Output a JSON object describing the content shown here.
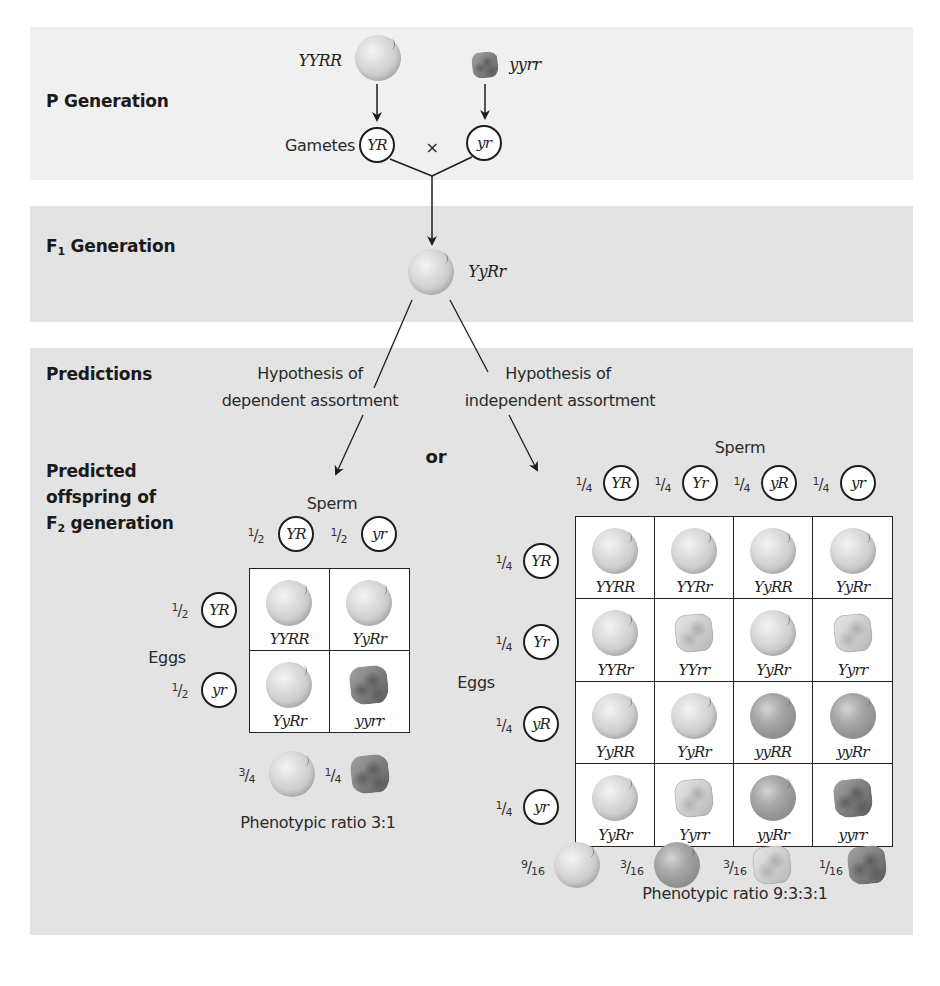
{
  "colors": {
    "panel_p_bg": "#f0f0f0",
    "panel_bg": "#e3e3e3",
    "round_yellow": "#d0d0d0",
    "round_green": "#9a9a9a",
    "wrinkled_yellow": "#cfcfcf",
    "wrinkled_green": "#7d7d7d",
    "line": "#1e1e1e"
  },
  "sections": {
    "p_generation": "P Generation",
    "f1_generation_prefix": "F",
    "f1_generation_sub": "1",
    "f1_generation_suffix": " Generation",
    "predictions": "Predictions",
    "predicted_line1": "Predicted",
    "predicted_line2": "offspring of",
    "predicted_line3_prefix": "F",
    "predicted_line3_sub": "2",
    "predicted_line3_suffix": " generation"
  },
  "p_generation": {
    "parent1_genotype": "YYRR",
    "parent1_phenotype": "round-yellow",
    "parent2_genotype": "yyrr",
    "parent2_phenotype": "wrinkled-green",
    "gametes_label": "Gametes",
    "gamete1": "YR",
    "cross_symbol": "×",
    "gamete2": "yr"
  },
  "f1_generation": {
    "genotype": "YyRr",
    "phenotype": "round-yellow"
  },
  "predictions": {
    "or_label": "or",
    "dependent": {
      "line1": "Hypothesis of",
      "line2": "dependent assortment",
      "sperm_label": "Sperm",
      "eggs_label": "Eggs",
      "sperm": [
        {
          "fraction_num": "1",
          "fraction_den": "2",
          "gamete": "YR"
        },
        {
          "fraction_num": "1",
          "fraction_den": "2",
          "gamete": "yr"
        }
      ],
      "eggs": [
        {
          "fraction_num": "1",
          "fraction_den": "2",
          "gamete": "YR"
        },
        {
          "fraction_num": "1",
          "fraction_den": "2",
          "gamete": "yr"
        }
      ],
      "grid": [
        [
          {
            "genotype": "YYRR",
            "phenotype": "round-yellow"
          },
          {
            "genotype": "YyRr",
            "phenotype": "round-yellow"
          }
        ],
        [
          {
            "genotype": "YyRr",
            "phenotype": "round-yellow"
          },
          {
            "genotype": "yyrr",
            "phenotype": "wrinkled-green"
          }
        ]
      ],
      "phenotype_summary": [
        {
          "fraction_num": "3",
          "fraction_den": "4",
          "phenotype": "round-yellow"
        },
        {
          "fraction_num": "1",
          "fraction_den": "4",
          "phenotype": "wrinkled-green"
        }
      ],
      "ratio_label": "Phenotypic ratio 3:1"
    },
    "independent": {
      "line1": "Hypothesis of",
      "line2": "independent assortment",
      "sperm_label": "Sperm",
      "eggs_label": "Eggs",
      "sperm": [
        {
          "fraction_num": "1",
          "fraction_den": "4",
          "gamete": "YR"
        },
        {
          "fraction_num": "1",
          "fraction_den": "4",
          "gamete": "Yr"
        },
        {
          "fraction_num": "1",
          "fraction_den": "4",
          "gamete": "yR"
        },
        {
          "fraction_num": "1",
          "fraction_den": "4",
          "gamete": "yr"
        }
      ],
      "eggs": [
        {
          "fraction_num": "1",
          "fraction_den": "4",
          "gamete": "YR"
        },
        {
          "fraction_num": "1",
          "fraction_den": "4",
          "gamete": "Yr"
        },
        {
          "fraction_num": "1",
          "fraction_den": "4",
          "gamete": "yR"
        },
        {
          "fraction_num": "1",
          "fraction_den": "4",
          "gamete": "yr"
        }
      ],
      "grid": [
        [
          {
            "genotype": "YYRR",
            "phenotype": "round-yellow"
          },
          {
            "genotype": "YYRr",
            "phenotype": "round-yellow"
          },
          {
            "genotype": "YyRR",
            "phenotype": "round-yellow"
          },
          {
            "genotype": "YyRr",
            "phenotype": "round-yellow"
          }
        ],
        [
          {
            "genotype": "YYRr",
            "phenotype": "round-yellow"
          },
          {
            "genotype": "YYrr",
            "phenotype": "wrinkled-yellow"
          },
          {
            "genotype": "YyRr",
            "phenotype": "round-yellow"
          },
          {
            "genotype": "Yyrr",
            "phenotype": "wrinkled-yellow"
          }
        ],
        [
          {
            "genotype": "YyRR",
            "phenotype": "round-yellow"
          },
          {
            "genotype": "YyRr",
            "phenotype": "round-yellow"
          },
          {
            "genotype": "yyRR",
            "phenotype": "round-green"
          },
          {
            "genotype": "yyRr",
            "phenotype": "round-green"
          }
        ],
        [
          {
            "genotype": "YyRr",
            "phenotype": "round-yellow"
          },
          {
            "genotype": "Yyrr",
            "phenotype": "wrinkled-yellow"
          },
          {
            "genotype": "yyRr",
            "phenotype": "round-green"
          },
          {
            "genotype": "yyrr",
            "phenotype": "wrinkled-green"
          }
        ]
      ],
      "phenotype_summary": [
        {
          "fraction_num": "9",
          "fraction_den": "16",
          "phenotype": "round-yellow"
        },
        {
          "fraction_num": "3",
          "fraction_den": "16",
          "phenotype": "round-green"
        },
        {
          "fraction_num": "3",
          "fraction_den": "16",
          "phenotype": "wrinkled-yellow"
        },
        {
          "fraction_num": "1",
          "fraction_den": "16",
          "phenotype": "wrinkled-green"
        }
      ],
      "ratio_label": "Phenotypic ratio 9:3:3:1"
    }
  }
}
